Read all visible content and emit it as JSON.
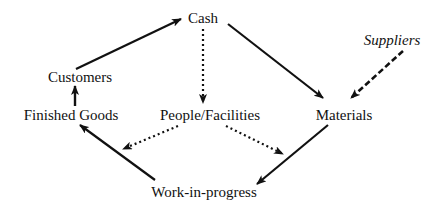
{
  "diagram": {
    "type": "cash-flow-cycle",
    "nodes": {
      "cash": {
        "label": "Cash",
        "x": 203,
        "y": 17
      },
      "customers": {
        "label": "Customers",
        "x": 80,
        "y": 77
      },
      "finished_goods": {
        "label": "Finished Goods",
        "x": 71,
        "y": 115
      },
      "people_facilities": {
        "label": "People/Facilities",
        "x": 210,
        "y": 115
      },
      "materials": {
        "label": "Materials",
        "x": 344,
        "y": 115
      },
      "suppliers": {
        "label": "Suppliers",
        "x": 392,
        "y": 40,
        "style": "italic"
      },
      "work_in_progress": {
        "label": "Work-in-progress",
        "x": 204,
        "y": 192
      }
    },
    "edges": [
      {
        "from": "customers",
        "to": "cash",
        "style": "solid"
      },
      {
        "from": "cash",
        "to": "materials",
        "style": "solid"
      },
      {
        "from": "cash",
        "to": "people_facilities",
        "style": "dotted"
      },
      {
        "from": "suppliers",
        "to": "materials",
        "style": "dashed"
      },
      {
        "from": "finished_goods",
        "to": "customers",
        "style": "solid"
      },
      {
        "from": "work_in_progress",
        "to": "finished_goods",
        "style": "solid"
      },
      {
        "from": "materials",
        "to": "work_in_progress",
        "style": "solid"
      },
      {
        "from": "people_facilities",
        "to": "work_in_progress",
        "style": "dotted"
      },
      {
        "from": "people_facilities",
        "to": "finished_goods",
        "style": "dotted"
      }
    ],
    "colors": {
      "stroke": "#111111",
      "background": "#ffffff"
    }
  }
}
